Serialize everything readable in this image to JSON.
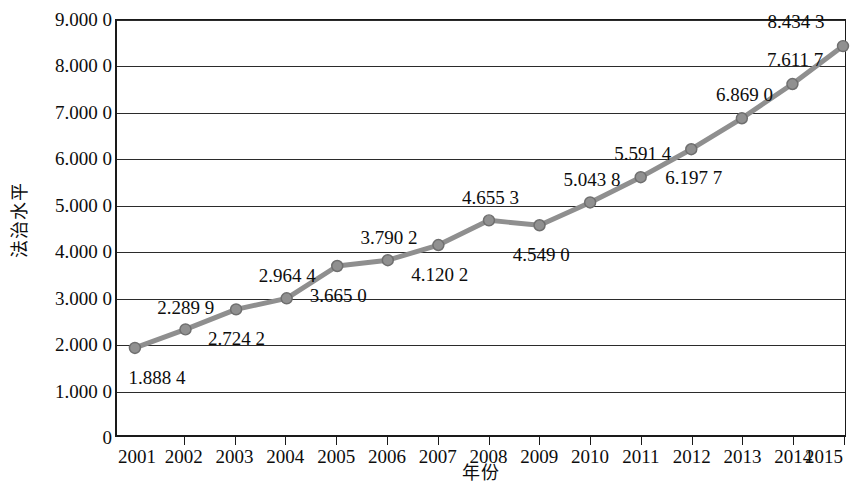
{
  "chart_data": {
    "type": "line",
    "title": "",
    "xlabel": "年份",
    "ylabel": "法治水平",
    "categories": [
      "2001",
      "2002",
      "2003",
      "2004",
      "2005",
      "2006",
      "2007",
      "2008",
      "2009",
      "2010",
      "2011",
      "2012",
      "2013",
      "2014",
      "2015"
    ],
    "values": [
      1.8884,
      2.2899,
      2.7242,
      2.9644,
      3.665,
      3.7902,
      4.1202,
      4.6553,
      4.549,
      5.0438,
      5.5914,
      6.1977,
      6.869,
      7.6117,
      8.4343
    ],
    "point_labels": [
      "1.888 4",
      "2.289 9",
      "2.724 2",
      "2.964 4",
      "3.665 0",
      "3.790 2",
      "4.120 2",
      "4.655 3",
      "4.549 0",
      "5.043 8",
      "5.591 4",
      "6.197 7",
      "6.869 0",
      "7.611 7",
      "8.434 3"
    ],
    "label_positions": [
      "below",
      "above",
      "below",
      "above",
      "below",
      "above",
      "below",
      "above",
      "below",
      "above",
      "above",
      "below",
      "above",
      "above",
      "above"
    ],
    "ylim": [
      0,
      9
    ],
    "ytick_values": [
      9,
      8,
      7,
      6,
      5,
      4,
      3,
      2,
      1,
      0
    ],
    "ytick_labels": [
      "9.000 0",
      "8.000 0",
      "7.000 0",
      "6.000 0",
      "5.000 0",
      "4.000 0",
      "3.000 0",
      "2.000 0",
      "1.000 0",
      "0"
    ],
    "xtick_labels": [
      "2001",
      "2002",
      "2003",
      "2004",
      "2005",
      "2006",
      "2007",
      "2008",
      "2009",
      "2010",
      "2011",
      "2012",
      "2013",
      "2014",
      "2015"
    ],
    "grid": true,
    "grid_axis": "y",
    "legend": null,
    "series_color": "#8f8f8f",
    "marker_color": "#909090",
    "marker_edge_color": "#6f6f6f",
    "axis_color": "#1a1a1a",
    "text_color": "#0d0d0d",
    "background": "#ffffff",
    "line_width": 5,
    "marker": "circle",
    "marker_size": 11
  }
}
